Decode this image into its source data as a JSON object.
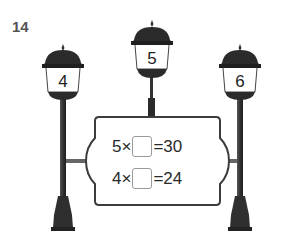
{
  "problem": {
    "number": "14"
  },
  "lamps": [
    {
      "label": "4"
    },
    {
      "label": "5"
    },
    {
      "label": "6"
    }
  ],
  "board": {
    "equations": [
      {
        "left": "5",
        "operator": "×",
        "blank": "",
        "equals": "=",
        "result": "30"
      },
      {
        "left": "4",
        "operator": "×",
        "blank": "",
        "equals": "=",
        "result": "24"
      }
    ]
  },
  "colors": {
    "lamp_dark": "#2b2b2b",
    "post": "#3a3a3a",
    "board_border": "#3c3c3c",
    "blank_border": "#9a9a9a",
    "number_gray": "#555555"
  }
}
